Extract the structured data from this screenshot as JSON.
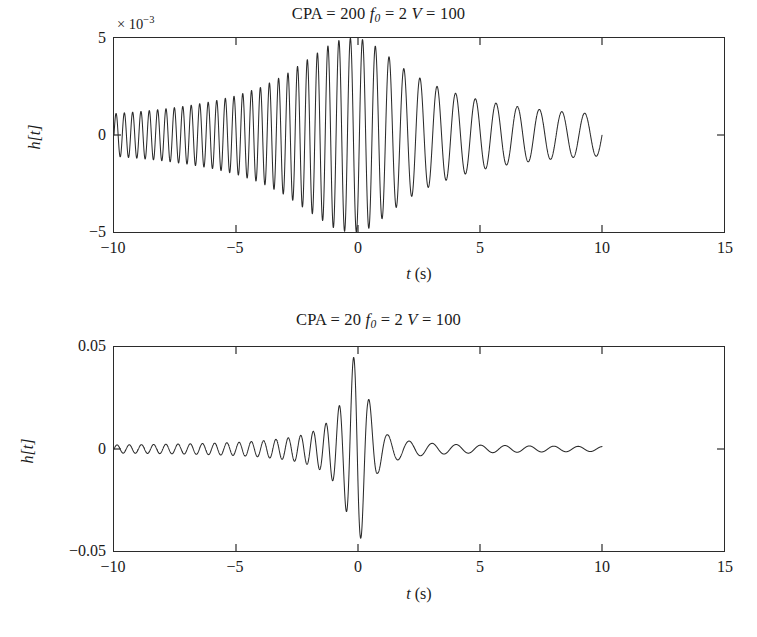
{
  "figure": {
    "background_color": "#ffffff",
    "line_color": "#2b2b2b",
    "panel_count": 2
  },
  "panels": {
    "top": {
      "title_full": "CPA = 200 f0 = 2 V = 100",
      "title_parts": {
        "cpa_label": "CPA",
        "eq1": " = ",
        "cpa_value": "200",
        "f_label": "f",
        "f_sub": "0",
        "eq2": " = ",
        "f_value": "2",
        "v_label": "V",
        "eq3": " = ",
        "v_value": "100"
      },
      "exponent_label": "× 10",
      "exponent_power": "−3",
      "ylabel": "h[t]",
      "xlabel_var": "t",
      "xlabel_unit": "(s)",
      "yticks": [
        "5",
        "0",
        "−5"
      ],
      "xticks": [
        "−10",
        "−5",
        "0",
        "5",
        "10",
        "15"
      ]
    },
    "bottom": {
      "title_full": "CPA = 20 f0 = 2 V = 100",
      "title_parts": {
        "cpa_label": "CPA",
        "eq1": " = ",
        "cpa_value": "20",
        "f_label": "f",
        "f_sub": "0",
        "eq2": " = ",
        "f_value": "2",
        "v_label": "V",
        "eq3": " = ",
        "v_value": "100"
      },
      "exponent_label": "",
      "exponent_power": "",
      "ylabel": "h[t]",
      "xlabel_var": "t",
      "xlabel_unit": "(s)",
      "yticks": [
        "0.05",
        "0",
        "−0.05"
      ],
      "xticks": [
        "−10",
        "−5",
        "0",
        "5",
        "10",
        "15"
      ]
    }
  },
  "chart_data": [
    {
      "type": "line",
      "title": "CPA = 200 f0 = 2 V = 100",
      "xlabel": "t (s)",
      "ylabel": "h[t]",
      "xlim": [
        -10,
        15
      ],
      "ylim": [
        -0.005,
        0.005
      ],
      "y_scale_exponent": -3,
      "xticks": [
        -10,
        -5,
        0,
        5,
        10,
        15
      ],
      "yticks": [
        -0.005,
        0,
        0.005
      ],
      "grid": false,
      "legend": null,
      "data_extent_x": [
        -10,
        10
      ],
      "model": {
        "description": "CPA doppler chirp: amplitude envelope peaks at t=0, instantaneous frequency decreases monotonically through the closest-point-of-approach",
        "CPA": 200,
        "f0": 2,
        "V": 100,
        "peak_amplitude": 0.005,
        "amplitude_at_t_minus10": 0.0011,
        "amplitude_at_t_plus10": 0.0011,
        "cycles_left_half": 44,
        "cycles_right_half": 9
      },
      "series": [
        {
          "name": "h[t]",
          "envelope_x": [
            -10,
            -9,
            -8,
            -7,
            -6,
            -5,
            -4,
            -3,
            -2,
            -1,
            -0.5,
            0,
            0.5,
            1,
            2,
            3,
            4,
            5,
            6,
            7,
            8,
            9,
            10
          ],
          "envelope_y": [
            0.0011,
            0.0012,
            0.00133,
            0.0015,
            0.00172,
            0.00202,
            0.00245,
            0.00308,
            0.00395,
            0.00478,
            0.00498,
            0.005,
            0.00478,
            0.0043,
            0.0033,
            0.00262,
            0.00215,
            0.0018,
            0.00156,
            0.00138,
            0.00124,
            0.00114,
            0.00108
          ],
          "frequency_x": [
            -10,
            -8,
            -6,
            -4,
            -2,
            -1,
            0,
            1,
            2,
            4,
            6,
            8,
            10
          ],
          "frequency_y": [
            2.95,
            2.92,
            2.86,
            2.74,
            2.45,
            2.22,
            2.0,
            1.78,
            1.55,
            1.26,
            1.14,
            1.08,
            1.05
          ]
        }
      ]
    },
    {
      "type": "line",
      "title": "CPA = 20 f0 = 2 V = 100",
      "xlabel": "t (s)",
      "ylabel": "h[t]",
      "xlim": [
        -10,
        15
      ],
      "ylim": [
        -0.05,
        0.05
      ],
      "y_scale_exponent": 0,
      "xticks": [
        -10,
        -5,
        0,
        5,
        10,
        15
      ],
      "yticks": [
        -0.05,
        0,
        0.05
      ],
      "grid": false,
      "legend": null,
      "data_extent_x": [
        -10,
        10
      ],
      "model": {
        "description": "CPA doppler chirp with small closest-point-of-approach: sharp impulsive peak at t=0, rapid decay either side",
        "CPA": 20,
        "f0": 2,
        "V": 100,
        "peak_amplitude": 0.05,
        "min_amplitude": -0.038,
        "amplitude_at_t_minus10": 0.002,
        "amplitude_at_t_plus10": 0.0012,
        "cycles_left_half": 38,
        "cycles_right_half": 9
      },
      "series": [
        {
          "name": "h[t]",
          "envelope_x": [
            -10,
            -9,
            -8,
            -7,
            -6,
            -5,
            -4,
            -3,
            -2.5,
            -2,
            -1.5,
            -1,
            -0.6,
            -0.3,
            -0.1,
            0,
            0.15,
            0.4,
            0.8,
            1.2,
            2,
            3,
            4,
            5,
            6,
            7,
            8,
            9,
            10
          ],
          "envelope_y": [
            0.002,
            0.0021,
            0.0023,
            0.0025,
            0.0028,
            0.0032,
            0.0039,
            0.0052,
            0.0062,
            0.0078,
            0.0105,
            0.016,
            0.025,
            0.039,
            0.049,
            0.05,
            0.042,
            0.026,
            0.012,
            0.007,
            0.004,
            0.0028,
            0.0022,
            0.0019,
            0.0017,
            0.0015,
            0.0014,
            0.0013,
            0.0012
          ],
          "frequency_x": [
            -10,
            -8,
            -6,
            -4,
            -2,
            -1,
            0,
            1,
            2,
            4,
            6,
            8,
            10
          ],
          "frequency_y": [
            2.0,
            2.0,
            2.0,
            1.99,
            1.95,
            1.85,
            1.6,
            1.25,
            1.08,
            1.0,
            1.0,
            1.0,
            1.0
          ]
        }
      ]
    }
  ]
}
